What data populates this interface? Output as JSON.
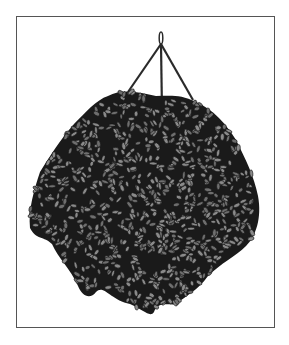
{
  "illustration": {
    "subject": "hanging plant basket",
    "colors": {
      "background": "#ffffff",
      "frame": "#555555",
      "foliage_dark": "#1a1a1a",
      "leaf_fill": "#6e6e6e",
      "leaf_fill_light": "#8a8a8a",
      "rope": "#2a2a2a"
    },
    "hook": {
      "x": 161,
      "top": 32,
      "junction": 44
    },
    "ropes": [
      {
        "x2": 128,
        "y2": 92
      },
      {
        "x2": 162,
        "y2": 112
      },
      {
        "x2": 193,
        "y2": 100
      }
    ],
    "foliage": {
      "outline": "M40,172 C34,190 28,210 30,228 C36,240 44,236 52,244 C58,258 70,268 78,286 C82,296 90,300 96,292 C104,284 110,300 130,304 C144,310 150,318 154,312 C158,300 170,306 176,304 C186,296 198,290 208,276 C220,264 236,256 246,246 C256,236 262,218 258,196 C254,176 246,160 236,140 C226,124 214,110 196,102 C180,94 170,96 156,96 C140,92 122,88 108,96 C96,100 86,112 74,124 C60,140 50,156 40,172 Z"
    },
    "leaf_seed": 7,
    "leaf_count": 900
  }
}
